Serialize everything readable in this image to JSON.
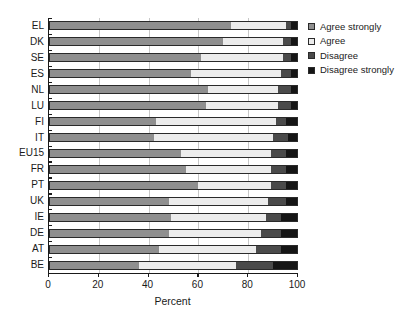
{
  "chart_data": {
    "type": "bar",
    "orientation": "horizontal",
    "stacked": true,
    "normalized_percent": true,
    "title": "",
    "subtitle": "",
    "xlabel": "Percent",
    "ylabel": "",
    "xlim": [
      0,
      100
    ],
    "xticks": [
      0,
      20,
      40,
      60,
      80,
      100
    ],
    "xticklabels": [
      "0",
      "20",
      "40",
      "60",
      "80",
      "100"
    ],
    "gridlines": [
      20,
      40,
      60,
      80
    ],
    "grid": true,
    "legend_position": "right",
    "categories": [
      "EL",
      "DK",
      "SE",
      "ES",
      "NL",
      "LU",
      "FI",
      "IT",
      "EU15",
      "FR",
      "PT",
      "UK",
      "IE",
      "DE",
      "AT",
      "BE"
    ],
    "series": [
      {
        "name": "Agree strongly",
        "color": "#8f8f8f",
        "values": [
          73,
          70,
          61,
          57,
          64,
          63,
          43,
          42,
          53,
          55,
          60,
          48,
          49,
          48,
          44,
          36
        ]
      },
      {
        "name": "Agree",
        "color": "#ececec",
        "values": [
          22,
          24,
          33,
          36,
          28,
          29,
          48,
          48,
          36,
          34,
          29,
          40,
          38,
          37,
          39,
          39
        ]
      },
      {
        "name": "Disagree",
        "color": "#4a4a4a",
        "values": [
          2,
          3,
          3,
          4,
          5,
          5,
          4,
          6,
          6,
          6,
          6,
          7,
          6,
          8,
          10,
          15
        ]
      },
      {
        "name": "Disagree strongly",
        "color": "#151515",
        "values": [
          3,
          3,
          3,
          3,
          3,
          3,
          5,
          4,
          5,
          5,
          5,
          5,
          7,
          7,
          7,
          10
        ]
      }
    ],
    "legend": [
      {
        "label": "Agree strongly",
        "swatch": "#8f8f8f"
      },
      {
        "label": "Agree",
        "swatch": "#ececec"
      },
      {
        "label": "Disagree",
        "swatch": "#4a4a4a"
      },
      {
        "label": "Disagree strongly",
        "swatch": "#151515"
      }
    ]
  }
}
